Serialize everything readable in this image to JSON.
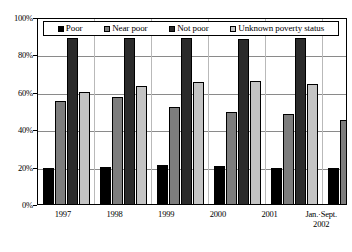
{
  "chart_data": {
    "type": "bar",
    "title": "",
    "subtitle": "",
    "xlabel": "",
    "ylabel": "",
    "ylim": [
      0,
      100
    ],
    "ytick_labels": [
      "100%",
      "80%",
      "60%",
      "40%",
      "20%",
      "0%"
    ],
    "ytick_values": [
      100,
      80,
      60,
      40,
      20,
      0
    ],
    "grid": "horizontal",
    "legend_position": "top-inside",
    "categories": [
      "1997",
      "1998",
      "1999",
      "2000",
      "2001",
      "Jan.-Sept. 2002"
    ],
    "category_lines": [
      [
        "1997"
      ],
      [
        "1998"
      ],
      [
        "1999"
      ],
      [
        "2000"
      ],
      [
        "2001"
      ],
      [
        "Jan.·Sept.",
        "2002"
      ]
    ],
    "series": [
      {
        "name": "Poor",
        "color": "#000000",
        "values": [
          19,
          20,
          21,
          20.5,
          19.5,
          19.5
        ]
      },
      {
        "name": "Near poor",
        "color": "#7d7d7d",
        "values": [
          55,
          57,
          52,
          49,
          48,
          45
        ]
      },
      {
        "name": "Not poor",
        "color": "#2b2b2b",
        "values": [
          89,
          89,
          89,
          88,
          89,
          87
        ]
      },
      {
        "name": "Unknown poverty status",
        "color": "#c4c4c4",
        "values": [
          60,
          63,
          65,
          66,
          64,
          57
        ]
      }
    ]
  },
  "legend": {
    "entries": [
      {
        "label": "Poor"
      },
      {
        "label": "Near poor"
      },
      {
        "label": "Not poor"
      },
      {
        "label": "Unknown poverty status"
      }
    ]
  }
}
